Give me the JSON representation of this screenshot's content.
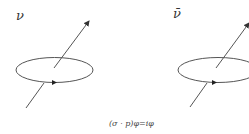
{
  "diagram": {
    "left": {
      "label": "ν"
    },
    "right": {
      "label": "ν̄"
    },
    "caption": "(σ · p)φ=iφ",
    "stroke_color": "#555555"
  }
}
